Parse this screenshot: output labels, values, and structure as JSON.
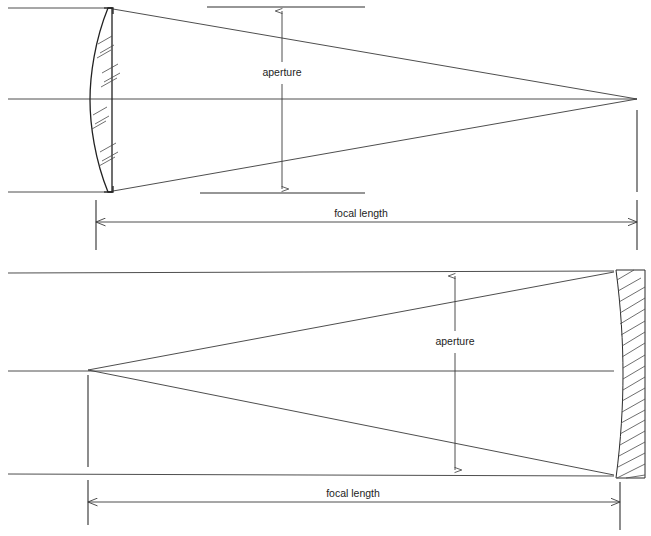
{
  "figure": {
    "background_color": "#ffffff",
    "line_color": "#2b2b2b",
    "width": 651,
    "height": 536
  },
  "diagrams": [
    {
      "id": "refractor-lens",
      "name": "Lens (refractor) aperture and focal length",
      "element_type": "plano-convex-lens",
      "aperture_label": "aperture",
      "focal_length_label": "focal length",
      "optic_axis_y": 99,
      "aperture_top_y": 8,
      "aperture_bottom_y": 192,
      "aperture_arrow_x": 282,
      "lens_flat_x": 113,
      "lens_curve_apex_x": 90,
      "focus_x": 637,
      "focus_y": 99,
      "focal_dim_y": 222,
      "focal_dim_x1": 96,
      "focal_dim_x2": 637,
      "aperture_label_x": 282,
      "aperture_label_y": 73,
      "focal_label_x": 361,
      "focal_label_y": 214
    },
    {
      "id": "reflector-mirror",
      "name": "Mirror (reflector) aperture and focal length",
      "element_type": "concave-mirror",
      "aperture_label": "aperture",
      "focal_length_label": "focal length",
      "optic_axis_y": 371,
      "aperture_top_y": 272,
      "aperture_bottom_y": 473,
      "aperture_arrow_x": 455,
      "mirror_front_x": 615,
      "mirror_back_x": 645,
      "mirror_top_y": 270,
      "mirror_bottom_y": 478,
      "focus_x": 88,
      "focus_y": 370,
      "focal_dim_y": 502,
      "focal_dim_x1": 88,
      "focal_dim_x2": 620,
      "aperture_label_x": 455,
      "aperture_label_y": 342,
      "focal_label_x": 353,
      "focal_label_y": 494
    }
  ]
}
